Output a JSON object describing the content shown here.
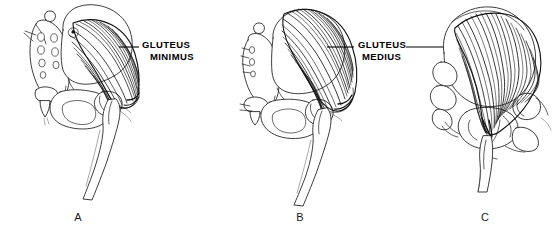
{
  "figure": {
    "kind": "anatomical-line-drawing",
    "background_color": "#ffffff",
    "ink_color": "#111111",
    "width": 555,
    "height": 233
  },
  "labels": [
    {
      "id": "gluteus-minimus",
      "line1": "GLUTEUS",
      "line2": "MINIMUS",
      "x": 142,
      "y": 44,
      "leaders": [
        {
          "x1": 119,
          "y1": 47,
          "x2": 139,
          "y2": 47
        }
      ]
    },
    {
      "id": "gluteus-medius",
      "line1": "GLUTEUS",
      "line2": "MEDIUS",
      "x": 358,
      "y": 44,
      "leaders": [
        {
          "x1": 327,
          "y1": 47,
          "x2": 354,
          "y2": 47
        },
        {
          "x1": 406,
          "y1": 47,
          "x2": 443,
          "y2": 47
        }
      ]
    }
  ],
  "panels": [
    {
      "id": "panel-a",
      "letter": "A",
      "letter_x": 78,
      "letter_y": 221,
      "muscle": "gluteus minimus",
      "view": "lateral, with sacrum and coccyx",
      "features": [
        "sacrum",
        "sacral foramina",
        "coccyx",
        "ilium",
        "iliac crest",
        "obturator foramen",
        "femur",
        "greater trochanter"
      ]
    },
    {
      "id": "panel-b",
      "letter": "B",
      "letter_x": 300,
      "letter_y": 221,
      "muscle": "gluteus medius",
      "view": "lateral, dense fiber fan over ilium",
      "features": [
        "sacrum",
        "ilium",
        "iliac crest",
        "obturator foramen",
        "femur",
        "greater trochanter"
      ]
    },
    {
      "id": "panel-c",
      "letter": "C",
      "letter_x": 485,
      "letter_y": 221,
      "muscle": "gluteus medius",
      "view": "posterior, fibers converging on greater trochanter",
      "features": [
        "ilium",
        "iliac crest",
        "ischium",
        "femur",
        "greater trochanter"
      ]
    }
  ]
}
